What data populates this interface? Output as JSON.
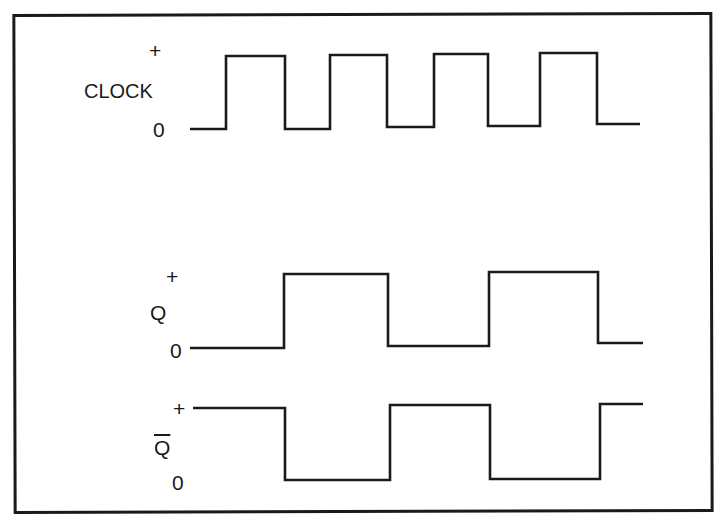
{
  "diagram": {
    "line_color": "#1a1a1a",
    "background": "#ffffff",
    "signals": [
      {
        "name": "CLOCK",
        "high_label": "+",
        "low_label": "0",
        "high_y": 56,
        "low_y": 129,
        "points": [
          [
            190,
            129
          ],
          [
            226,
            129
          ],
          [
            226,
            56
          ],
          [
            285,
            56
          ],
          [
            285,
            129
          ],
          [
            330,
            129
          ],
          [
            330,
            55
          ],
          [
            387,
            55
          ],
          [
            387,
            127
          ],
          [
            434,
            127
          ],
          [
            434,
            54
          ],
          [
            488,
            54
          ],
          [
            488,
            126
          ],
          [
            540,
            126
          ],
          [
            540,
            53
          ],
          [
            597,
            53
          ],
          [
            597,
            124
          ],
          [
            640,
            124
          ]
        ]
      },
      {
        "name": "Q",
        "high_label": "+",
        "low_label": "0",
        "high_y": 274,
        "low_y": 348,
        "points": [
          [
            190,
            348
          ],
          [
            284,
            348
          ],
          [
            284,
            274
          ],
          [
            388,
            274
          ],
          [
            388,
            346
          ],
          [
            489,
            346
          ],
          [
            489,
            272
          ],
          [
            598,
            272
          ],
          [
            598,
            343
          ],
          [
            643,
            343
          ]
        ]
      },
      {
        "name": "Q̄",
        "display": "Q",
        "overbar": true,
        "high_label": "+",
        "low_label": "0",
        "high_y": 408,
        "low_y": 480,
        "points": [
          [
            193,
            408
          ],
          [
            285,
            408
          ],
          [
            285,
            480
          ],
          [
            390,
            480
          ],
          [
            390,
            405
          ],
          [
            490,
            405
          ],
          [
            490,
            479
          ],
          [
            600,
            479
          ],
          [
            600,
            404
          ],
          [
            643,
            404
          ]
        ]
      }
    ]
  },
  "labels": {
    "clock_plus": "+",
    "clock_name": "CLOCK",
    "clock_zero": "0",
    "q_plus": "+",
    "q_name": "Q",
    "q_zero": "0",
    "qbar_plus": "+",
    "qbar_name": "Q",
    "qbar_zero": "0"
  }
}
